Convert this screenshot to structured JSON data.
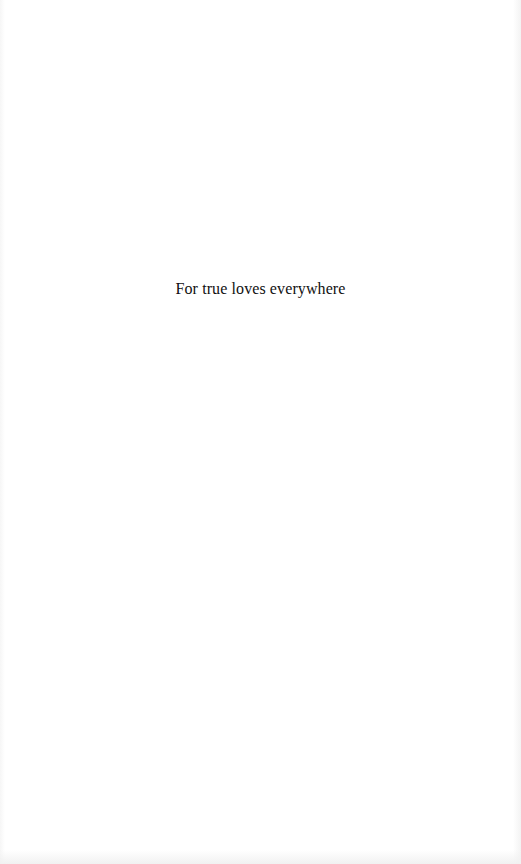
{
  "page": {
    "type": "dedication",
    "background_color": "#ffffff",
    "text_color": "#111111"
  },
  "dedication": {
    "text": "For true loves everywhere"
  }
}
